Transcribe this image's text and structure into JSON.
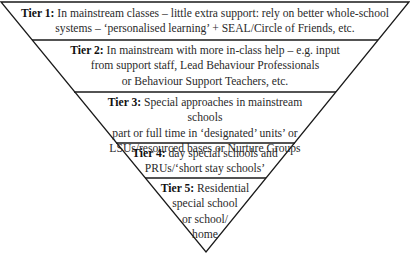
{
  "diagram": {
    "type": "inverted-triangle",
    "line_color": "#1a1a1a",
    "background": "#ffffff",
    "tiers": [
      {
        "label": "Tier 1:",
        "text": "In mainstream classes – little extra support: rely on better whole-school systems – ‘personalised learning’ + SEAL/Circle of Friends, etc.",
        "lines": [
          "In mainstream classes – little extra support: rely on better whole-school",
          "systems – ‘personalised learning’ + SEAL/Circle of Friends, etc."
        ]
      },
      {
        "label": "Tier 2:",
        "text": "In mainstream with more in-class help – e.g. input from support staff, Lead Behaviour Professionals or Behaviour Support Teachers, etc.",
        "lines": [
          "In mainstream with more in-class help – e.g. input",
          "from support staff, Lead Behaviour Professionals",
          "or Behaviour Support Teachers, etc."
        ]
      },
      {
        "label": "Tier 3:",
        "text": "Special approaches in mainstream schools part or full time in ‘designated’ units’ or LSUs/resourced bases or Nurture Groups",
        "lines": [
          "Special approaches in mainstream schools",
          "part or full time in ‘designated’ units’ or",
          "LSUs/resourced bases or Nurture Groups"
        ]
      },
      {
        "label": "Tier 4:",
        "text": "day special schools and PRUs/‘short stay schools’",
        "lines": [
          "day special schools and",
          "PRUs/‘short stay schools’"
        ]
      },
      {
        "label": "Tier 5:",
        "text": "Residential special school or school/ home",
        "lines": [
          "Residential",
          "special school",
          "or school/",
          "home"
        ]
      }
    ]
  }
}
